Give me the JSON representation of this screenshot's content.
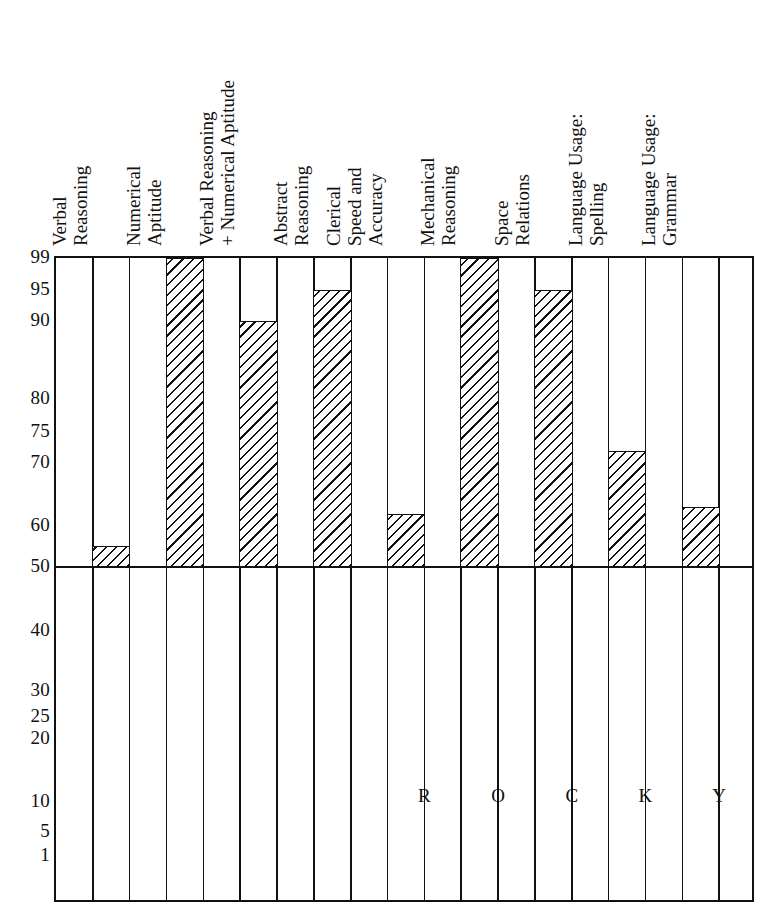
{
  "chart_data": {
    "type": "bar",
    "title": "",
    "subtitle": "",
    "xlabel": "",
    "ylabel": "",
    "grid": "vertical-column-separators",
    "legend": "none",
    "orientation": "vertical",
    "baseline": 50,
    "ylim": [
      1,
      99
    ],
    "ytick_labels": [
      "99",
      "95",
      "90",
      "80",
      "75",
      "70",
      "60",
      "50",
      "40",
      "30",
      "25",
      "20",
      "10",
      "5",
      "1"
    ],
    "ytick_values": [
      99,
      95,
      90,
      80,
      75,
      70,
      60,
      50,
      40,
      30,
      25,
      20,
      10,
      5,
      1
    ],
    "categories": [
      "Verbal Reasoning",
      "Numerical Aptitude",
      "Verbal Reasoning + Numerical Aptitude",
      "Abstract Reasoning",
      "Clerical Speed and Accuracy",
      "Mechanical Reasoning",
      "Space Relations",
      "Language Usage: Spelling",
      "Language Usage: Grammar"
    ],
    "category_lines": [
      [
        "Verbal",
        "Reasoning"
      ],
      [
        "Numerical",
        "Aptitude"
      ],
      [
        "Verbal Reasoning",
        "+ Numerical Aptitude"
      ],
      [
        "Abstract",
        "Reasoning"
      ],
      [
        "Clerical",
        "Speed and",
        "Accuracy"
      ],
      [
        "Mechanical",
        "Reasoning"
      ],
      [
        "Space",
        "Relations"
      ],
      [
        "Language Usage:",
        "Spelling"
      ],
      [
        "Language Usage:",
        "Grammar"
      ]
    ],
    "values": [
      55,
      99,
      90,
      95,
      62,
      99,
      95,
      72,
      63
    ],
    "annotation_letters": [
      "R",
      "O",
      "C",
      "K",
      "Y"
    ],
    "annotation_value": 11,
    "annotation_text": "ROCKY"
  },
  "colors": {
    "ink": "#111111",
    "paper": "#ffffff"
  }
}
